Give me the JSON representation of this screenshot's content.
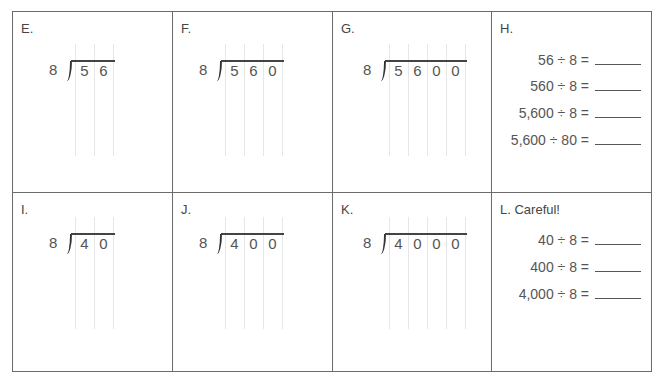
{
  "worksheet": {
    "problems": [
      {
        "id": "E",
        "label": "E.",
        "type": "long-division",
        "divisor": "8",
        "dividend_digits": [
          "5",
          "6"
        ]
      },
      {
        "id": "F",
        "label": "F.",
        "type": "long-division",
        "divisor": "8",
        "dividend_digits": [
          "5",
          "6",
          "0"
        ]
      },
      {
        "id": "G",
        "label": "G.",
        "type": "long-division",
        "divisor": "8",
        "dividend_digits": [
          "5",
          "6",
          "0",
          "0"
        ]
      },
      {
        "id": "H",
        "label": "H.",
        "type": "equations",
        "equations": [
          {
            "expr": "56 ÷ 8 =",
            "answer": ""
          },
          {
            "expr": "560 ÷ 8 =",
            "answer": ""
          },
          {
            "expr": "5,600 ÷ 8 =",
            "answer": ""
          },
          {
            "expr": "5,600 ÷ 80 =",
            "answer": ""
          }
        ]
      },
      {
        "id": "I",
        "label": "I.",
        "type": "long-division",
        "divisor": "8",
        "dividend_digits": [
          "4",
          "0"
        ]
      },
      {
        "id": "J",
        "label": "J.",
        "type": "long-division",
        "divisor": "8",
        "dividend_digits": [
          "4",
          "0",
          "0"
        ]
      },
      {
        "id": "K",
        "label": "K.",
        "type": "long-division",
        "divisor": "8",
        "dividend_digits": [
          "4",
          "0",
          "0",
          "0"
        ]
      },
      {
        "id": "L",
        "label": "L. Careful!",
        "type": "equations",
        "equations": [
          {
            "expr": "40 ÷ 8 =",
            "answer": ""
          },
          {
            "expr": "400 ÷ 8 =",
            "answer": ""
          },
          {
            "expr": "4,000 ÷ 8 =",
            "answer": ""
          }
        ]
      }
    ]
  }
}
